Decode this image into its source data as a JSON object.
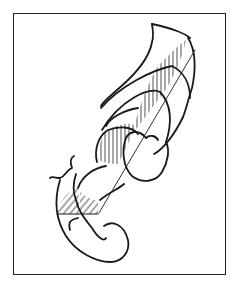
{
  "figure": {
    "stroke_color": "#1a1a1a",
    "frame_color": "#222222",
    "background": "#ffffff",
    "hatch_regions": 3
  },
  "caption": {
    "text": ""
  }
}
